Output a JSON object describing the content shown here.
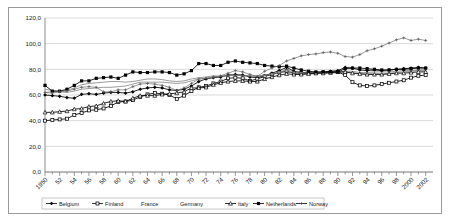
{
  "chart_data": {
    "type": "line",
    "title": "",
    "xlabel": "",
    "ylabel": "",
    "ylim": [
      0,
      120
    ],
    "ytick_labels": [
      "0,0",
      "20,0",
      "40,0",
      "60,0",
      "80,0",
      "100,0",
      "120,0"
    ],
    "ytick_values": [
      0,
      20,
      40,
      60,
      80,
      100,
      120
    ],
    "grid": true,
    "legend_position": "bottom",
    "xlim": [
      1950,
      2003
    ],
    "x": [
      1950,
      1951,
      1952,
      1953,
      1954,
      1955,
      1956,
      1957,
      1958,
      1959,
      1960,
      1961,
      1962,
      1963,
      1964,
      1965,
      1966,
      1967,
      1968,
      1969,
      1970,
      1971,
      1972,
      1973,
      1974,
      1975,
      1976,
      1977,
      1978,
      1979,
      1980,
      1981,
      1982,
      1983,
      1984,
      1985,
      1986,
      1987,
      1988,
      1989,
      1990,
      1991,
      1992,
      1993,
      1994,
      1995,
      1996,
      1997,
      1998,
      1999,
      2000,
      2001,
      2002
    ],
    "xtick_labels": [
      "1950",
      "52",
      "54",
      "56",
      "58",
      "60",
      "62",
      "64",
      "66",
      "68",
      "70",
      "72",
      "74",
      "76",
      "78",
      "80",
      "82",
      "84",
      "86",
      "88",
      "90",
      "92",
      "94",
      "96",
      "98",
      "2000",
      "2002"
    ],
    "xtick_values": [
      1950,
      1952,
      1954,
      1956,
      1958,
      1960,
      1962,
      1964,
      1966,
      1968,
      1970,
      1972,
      1974,
      1976,
      1978,
      1980,
      1982,
      1984,
      1986,
      1988,
      1990,
      1992,
      1994,
      1996,
      1998,
      2000,
      2002
    ],
    "series": [
      {
        "name": "Belgium",
        "marker": "diamond",
        "line": "thick",
        "values": [
          60.0,
          59.5,
          59.0,
          58.0,
          57.5,
          60.5,
          61.0,
          60.5,
          61.5,
          62.0,
          62.0,
          61.5,
          62.5,
          64.5,
          65.5,
          66.0,
          65.5,
          64.0,
          63.5,
          64.5,
          67.0,
          70.5,
          72.5,
          73.5,
          74.0,
          75.5,
          76.0,
          75.5,
          74.0,
          73.5,
          75.0,
          77.0,
          79.0,
          81.5,
          78.5,
          77.5,
          77.5,
          77.5,
          78.0,
          78.5,
          79.0,
          81.5,
          81.0,
          79.5,
          79.0,
          79.5,
          79.0,
          79.5,
          80.0,
          80.5,
          81.0,
          81.5,
          81.0
        ]
      },
      {
        "name": "Finland",
        "marker": "square",
        "line": "thick",
        "values": [
          40.0,
          40.5,
          41.0,
          41.5,
          44.5,
          46.0,
          48.0,
          48.5,
          49.5,
          51.5,
          54.5,
          55.0,
          56.0,
          58.5,
          60.5,
          61.5,
          61.0,
          60.0,
          57.0,
          59.5,
          63.0,
          66.0,
          67.0,
          69.0,
          70.5,
          73.0,
          73.5,
          73.0,
          71.0,
          72.5,
          74.5,
          76.0,
          77.5,
          78.5,
          77.0,
          77.0,
          77.0,
          77.0,
          77.5,
          77.5,
          78.0,
          75.5,
          70.0,
          67.5,
          67.0,
          67.5,
          68.5,
          69.5,
          70.5,
          71.5,
          73.5,
          75.0,
          75.5
        ]
      },
      {
        "name": "France",
        "marker": "none",
        "line": "thin",
        "values": [
          62.0,
          62.5,
          62.5,
          62.0,
          63.0,
          64.5,
          65.0,
          65.5,
          66.0,
          66.0,
          66.5,
          67.0,
          68.5,
          70.0,
          70.0,
          70.0,
          70.0,
          69.5,
          69.0,
          69.5,
          71.0,
          72.5,
          73.0,
          74.0,
          74.5,
          75.5,
          75.5,
          75.0,
          74.5,
          74.5,
          75.0,
          76.0,
          77.5,
          78.5,
          77.0,
          76.5,
          76.5,
          76.5,
          77.0,
          77.0,
          77.5,
          78.0,
          77.5,
          76.5,
          76.5,
          77.0,
          76.5,
          77.0,
          77.5,
          78.0,
          78.5,
          79.0,
          79.0
        ]
      },
      {
        "name": "Germany",
        "marker": "none",
        "line": "thin",
        "values": [
          64.5,
          63.5,
          63.0,
          63.5,
          65.5,
          68.0,
          69.0,
          69.5,
          70.0,
          70.5,
          70.5,
          70.0,
          70.5,
          71.5,
          72.5,
          72.5,
          72.0,
          71.0,
          70.5,
          71.0,
          72.5,
          73.5,
          74.0,
          75.0,
          74.5,
          75.0,
          75.5,
          75.5,
          75.0,
          75.0,
          75.5,
          76.5,
          78.0,
          79.5,
          78.0,
          77.5,
          77.5,
          77.5,
          77.5,
          77.5,
          78.0,
          78.5,
          78.5,
          77.5,
          77.5,
          78.0,
          78.0,
          78.0,
          78.5,
          79.0,
          79.0,
          79.5,
          79.5
        ]
      },
      {
        "name": "Italy",
        "marker": "triangle",
        "line": "thick",
        "values": [
          46.5,
          46.5,
          47.0,
          47.5,
          49.0,
          49.5,
          51.0,
          51.5,
          53.5,
          55.0,
          55.5,
          55.0,
          57.5,
          59.5,
          59.5,
          59.5,
          60.5,
          61.0,
          61.5,
          62.5,
          65.5,
          65.5,
          66.0,
          68.0,
          69.5,
          70.5,
          71.0,
          71.0,
          70.5,
          70.5,
          72.5,
          74.0,
          75.5,
          76.5,
          76.0,
          76.0,
          76.5,
          77.0,
          77.0,
          77.5,
          78.0,
          78.0,
          77.0,
          76.5,
          76.0,
          76.0,
          76.0,
          76.5,
          77.0,
          77.0,
          77.5,
          78.0,
          78.0
        ]
      },
      {
        "name": "Netherlands",
        "marker": "square-filled",
        "line": "thick",
        "values": [
          67.5,
          63.0,
          63.0,
          64.5,
          67.5,
          71.0,
          71.0,
          73.0,
          73.5,
          74.0,
          73.0,
          75.5,
          78.0,
          77.5,
          77.5,
          78.0,
          78.0,
          77.5,
          75.5,
          76.5,
          79.0,
          84.5,
          84.5,
          83.0,
          83.0,
          85.5,
          86.5,
          85.5,
          85.0,
          84.5,
          83.0,
          82.5,
          82.0,
          82.5,
          81.0,
          79.5,
          78.5,
          78.0,
          78.0,
          78.0,
          78.0,
          80.5,
          81.0,
          81.0,
          80.5,
          80.0,
          79.5,
          79.5,
          80.0,
          80.0,
          80.5,
          81.0,
          81.0
        ]
      },
      {
        "name": "Norway",
        "marker": "plus",
        "line": "thin",
        "values": [
          62.0,
          61.5,
          62.5,
          63.0,
          64.5,
          66.0,
          66.5,
          66.0,
          62.5,
          62.5,
          64.0,
          64.0,
          66.5,
          68.5,
          69.0,
          68.5,
          67.5,
          66.0,
          63.5,
          65.5,
          69.0,
          72.5,
          73.0,
          74.0,
          75.0,
          77.0,
          79.0,
          78.0,
          76.0,
          74.5,
          78.5,
          81.0,
          83.0,
          86.5,
          88.5,
          90.5,
          91.5,
          92.0,
          93.0,
          93.5,
          92.5,
          90.0,
          89.5,
          91.5,
          94.5,
          96.0,
          98.0,
          100.5,
          103.0,
          104.5,
          102.5,
          103.5,
          102.5
        ]
      }
    ]
  }
}
